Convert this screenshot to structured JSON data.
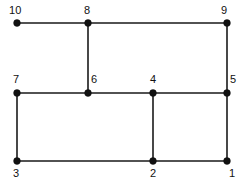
{
  "figure": {
    "type": "node-link-diagram",
    "background_color": "#ffffff",
    "line_color": "#1a1a1a",
    "node_color": "#111111",
    "width": 245,
    "height": 189
  },
  "nodes": [
    {
      "id": "1",
      "label": "1",
      "x": 227,
      "y": 161,
      "label_x": 229,
      "label_y": 168,
      "label_anchor": "below-right"
    },
    {
      "id": "2",
      "label": "2",
      "x": 153,
      "y": 161,
      "label_x": 150,
      "label_y": 168,
      "label_anchor": "below"
    },
    {
      "id": "3",
      "label": "3",
      "x": 17,
      "y": 161,
      "label_x": 13,
      "label_y": 168,
      "label_anchor": "below"
    },
    {
      "id": "4",
      "label": "4",
      "x": 153,
      "y": 93,
      "label_x": 150,
      "label_y": 74,
      "label_anchor": "above"
    },
    {
      "id": "5",
      "label": "5",
      "x": 227,
      "y": 93,
      "label_x": 230,
      "label_y": 74,
      "label_anchor": "above-right"
    },
    {
      "id": "6",
      "label": "6",
      "x": 88,
      "y": 93,
      "label_x": 91,
      "label_y": 74,
      "label_anchor": "above-right"
    },
    {
      "id": "7",
      "label": "7",
      "x": 17,
      "y": 93,
      "label_x": 13,
      "label_y": 74,
      "label_anchor": "above"
    },
    {
      "id": "8",
      "label": "8",
      "x": 88,
      "y": 23,
      "label_x": 84,
      "label_y": 5,
      "label_anchor": "above"
    },
    {
      "id": "9",
      "label": "9",
      "x": 227,
      "y": 23,
      "label_x": 221,
      "label_y": 5,
      "label_anchor": "above-left"
    },
    {
      "id": "10",
      "label": "10",
      "x": 17,
      "y": 23,
      "label_x": 9,
      "label_y": 5,
      "label_anchor": "above-left"
    }
  ],
  "edges": [
    {
      "from": "10",
      "to": "8",
      "x1": 17,
      "y1": 23,
      "x2": 88,
      "y2": 23
    },
    {
      "from": "8",
      "to": "9",
      "x1": 88,
      "y1": 23,
      "x2": 227,
      "y2": 23
    },
    {
      "from": "8",
      "to": "6",
      "x1": 88,
      "y1": 23,
      "x2": 88,
      "y2": 93
    },
    {
      "from": "9",
      "to": "5",
      "x1": 227,
      "y1": 23,
      "x2": 227,
      "y2": 93
    },
    {
      "from": "7",
      "to": "6",
      "x1": 17,
      "y1": 93,
      "x2": 88,
      "y2": 93
    },
    {
      "from": "6",
      "to": "4",
      "x1": 88,
      "y1": 93,
      "x2": 153,
      "y2": 93
    },
    {
      "from": "4",
      "to": "5",
      "x1": 153,
      "y1": 93,
      "x2": 227,
      "y2": 93
    },
    {
      "from": "7",
      "to": "3",
      "x1": 17,
      "y1": 93,
      "x2": 17,
      "y2": 161
    },
    {
      "from": "4",
      "to": "2",
      "x1": 153,
      "y1": 93,
      "x2": 153,
      "y2": 161
    },
    {
      "from": "5",
      "to": "1",
      "x1": 227,
      "y1": 93,
      "x2": 227,
      "y2": 161
    },
    {
      "from": "3",
      "to": "2",
      "x1": 17,
      "y1": 161,
      "x2": 153,
      "y2": 161
    },
    {
      "from": "2",
      "to": "1",
      "x1": 153,
      "y1": 161,
      "x2": 227,
      "y2": 161
    }
  ],
  "style": {
    "node_radius": 3.4,
    "edge_stroke_width": 1.6,
    "label_font_size": 11
  }
}
